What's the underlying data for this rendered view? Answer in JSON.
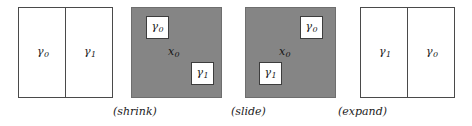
{
  "figure": {
    "width": 472,
    "height": 126,
    "background_color": "#ffffff",
    "gray_fill_color": "#858585",
    "white_fill_color": "#ffffff",
    "stroke_color": "#4a4a4a",
    "text_color": "#1a1a1a"
  },
  "panels": [
    {
      "id": "panel-initial",
      "kind": "split-rectangle",
      "left_label": "γ",
      "left_sub": "0",
      "right_label": "γ",
      "right_sub": "1"
    },
    {
      "id": "panel-shrink",
      "kind": "gray-square",
      "interior_label": "x",
      "interior_sub": "0",
      "inset_top_label": "γ",
      "inset_top_sub": "0",
      "inset_bottom_label": "γ",
      "inset_bottom_sub": "1"
    },
    {
      "id": "panel-slide",
      "kind": "gray-square",
      "interior_label": "x",
      "interior_sub": "0",
      "inset_top_label": "γ",
      "inset_top_sub": "0",
      "inset_bottom_label": "γ",
      "inset_bottom_sub": "1"
    },
    {
      "id": "panel-final",
      "kind": "split-rectangle",
      "left_label": "γ",
      "left_sub": "1",
      "right_label": "γ",
      "right_sub": "0"
    }
  ],
  "captions": {
    "shrink": "(shrink)",
    "slide": "(slide)",
    "expand": "(expand)"
  }
}
